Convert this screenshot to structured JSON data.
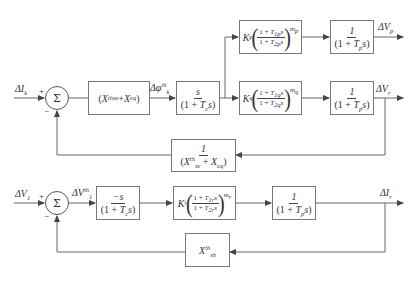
{
  "diagram": {
    "type": "control block diagram",
    "loops": [
      {
        "name": "series-loop",
        "input": "ΔI_k",
        "summing_junction": {
          "symbol": "Σ",
          "signs": {
            "in": "+",
            "feedback": "−"
          }
        },
        "forward_path": [
          {
            "id": "gain-xse-xeq",
            "label": "(X_se^th + X_eq)"
          },
          {
            "id": "washout-top",
            "label": "s / (1 + T_c s)"
          },
          {
            "id": "lead-lag-p",
            "label": "K_p((1 + T_1p s)/(1 + T_2p s))^m_p"
          },
          {
            "id": "lag-p",
            "label": "1 / (1 + T_p s)"
          },
          {
            "id": "lead-lag-q",
            "label": "K_q((1 + T_1q s)/(1 + T_2q s))^m_q"
          },
          {
            "id": "lag-q",
            "label": "1 / (1 + T_p s)"
          }
        ],
        "intermediate_signal": "Δφ_k^th",
        "outputs": [
          "ΔV_p",
          "ΔV_r"
        ],
        "feedback": {
          "id": "inv-xse-xeq",
          "label": "1 / (X_se^th + X_eq)",
          "from": "ΔV_r"
        }
      },
      {
        "name": "shunt-loop",
        "input": "ΔV_1",
        "summing_junction": {
          "symbol": "Σ",
          "signs": {
            "in": "+",
            "feedback": "−"
          }
        },
        "intermediate_signal": "ΔV_1^th",
        "forward_path": [
          {
            "id": "washout-bottom",
            "label": "−s / (1 + T_c s)"
          },
          {
            "id": "lead-lag-r",
            "label": "K_r((1 + T_1r s)/(1 + T_2r s))^m_r"
          },
          {
            "id": "lag-r",
            "label": "1 / (1 + T_p s)"
          }
        ],
        "outputs": [
          "ΔI_r"
        ],
        "feedback": {
          "id": "xsh",
          "label": "X_sh^th",
          "from": "ΔI_r"
        }
      }
    ]
  },
  "text": {
    "sigma": "Σ",
    "plus": "+",
    "minus": "−",
    "one": "1",
    "s": "s",
    "neg_s": "−s",
    "K": "K",
    "delta": "Δ",
    "open_paren": "(",
    "close_paren": ")",
    "one_plus": "(1 + ",
    "one_plus_np": "1 + ",
    "signals": {
      "dIk": {
        "base": "ΔI",
        "sub": "k"
      },
      "dphi": {
        "base": "Δφ",
        "sup": "th",
        "sub": "k"
      },
      "dVp": {
        "base": "ΔV",
        "sub": "p"
      },
      "dVr": {
        "base": "ΔV",
        "sub": "r"
      },
      "dV1": {
        "base": "ΔV",
        "sub": "1"
      },
      "dV1th": {
        "base": "ΔV",
        "sup": "th",
        "sub": "1"
      },
      "dIr": {
        "base": "ΔI",
        "sub": "r"
      }
    },
    "X": "X",
    "th": "th",
    "se": "se",
    "eq": "eq",
    "sh": "sh",
    "T": "T",
    "c": "c",
    "p": "p",
    "q": "q",
    "r": "r",
    "T1p": "1p",
    "T2p": "2p",
    "mp": "m",
    "mp_sub": "p",
    "T1q": "1q",
    "T2q": "2q",
    "mq": "m",
    "mq_sub": "q",
    "T1r": "1r",
    "T2r": "2r",
    "mr": "m",
    "mr_sub": "r",
    "plus_sp": " + "
  },
  "colors": {
    "line": "#555555",
    "box_border": "#777777",
    "text": "#333333",
    "background": "#ffffff"
  }
}
